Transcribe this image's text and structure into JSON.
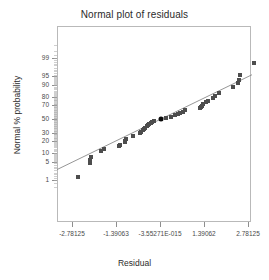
{
  "chart_data": {
    "type": "scatter",
    "title": "Normal plot of residuals",
    "xlabel": "Residual",
    "ylabel": "Normal % probability",
    "grid": false,
    "legend": null,
    "xlim": [
      -3.4,
      3.4
    ],
    "ylim_percent": [
      0.4,
      99.8
    ],
    "x_ticks": [
      {
        "value": -2.78125,
        "label": "-2.78125"
      },
      {
        "value": -1.39063,
        "label": "-1.39063"
      },
      {
        "value": 0,
        "label": "-3.55271E-015"
      },
      {
        "value": 1.39062,
        "label": "1.39062"
      },
      {
        "value": 2.78125,
        "label": "2.78125"
      }
    ],
    "y_ticks": [
      {
        "value": 99,
        "label": "99"
      },
      {
        "value": 95,
        "label": "95"
      },
      {
        "value": 90,
        "label": "90"
      },
      {
        "value": 80,
        "label": "80"
      },
      {
        "value": 70,
        "label": "70"
      },
      {
        "value": 50,
        "label": "50"
      },
      {
        "value": 30,
        "label": "30"
      },
      {
        "value": 20,
        "label": "20"
      },
      {
        "value": 10,
        "label": "10"
      },
      {
        "value": 5,
        "label": "5"
      },
      {
        "value": 1,
        "label": "1"
      }
    ],
    "reference_line": {
      "name": "normal-reference-line",
      "color": "#8a8a8a",
      "x_start": -3.4,
      "y_start_percent": 2.2,
      "x_end": 3.4,
      "y_end_percent": 97.6
    },
    "series": [
      {
        "name": "residual-points",
        "marker": "square",
        "color": "#4d4d4d",
        "points": [
          {
            "x": -2.6,
            "p": 1.4
          },
          {
            "x": -2.22,
            "p": 4.5
          },
          {
            "x": -2.2,
            "p": 6.1
          },
          {
            "x": -2.18,
            "p": 7.4
          },
          {
            "x": -1.86,
            "p": 11.0
          },
          {
            "x": -1.76,
            "p": 12.4
          },
          {
            "x": -1.3,
            "p": 15.0
          },
          {
            "x": -1.28,
            "p": 16.4
          },
          {
            "x": -1.12,
            "p": 18.8
          },
          {
            "x": -1.1,
            "p": 20.6
          },
          {
            "x": -1.08,
            "p": 22.2
          },
          {
            "x": -0.86,
            "p": 25.4
          },
          {
            "x": -0.62,
            "p": 30.0
          },
          {
            "x": -0.6,
            "p": 31.5
          },
          {
            "x": -0.54,
            "p": 33.2
          },
          {
            "x": -0.5,
            "p": 35.0
          },
          {
            "x": -0.46,
            "p": 37.0
          },
          {
            "x": -0.42,
            "p": 39.0
          },
          {
            "x": -0.38,
            "p": 41.0
          },
          {
            "x": -0.34,
            "p": 42.8
          },
          {
            "x": -0.3,
            "p": 44.6
          },
          {
            "x": -0.26,
            "p": 46.2
          },
          {
            "x": -0.2,
            "p": 47.6
          },
          {
            "x": 0.18,
            "p": 51.8
          },
          {
            "x": 0.34,
            "p": 53.5
          },
          {
            "x": 0.46,
            "p": 55.5
          },
          {
            "x": 0.58,
            "p": 57.5
          },
          {
            "x": 0.62,
            "p": 59.2
          },
          {
            "x": 0.74,
            "p": 61.0
          },
          {
            "x": 0.78,
            "p": 62.8
          },
          {
            "x": 1.26,
            "p": 66.0
          },
          {
            "x": 1.3,
            "p": 67.8
          },
          {
            "x": 1.34,
            "p": 69.6
          },
          {
            "x": 1.36,
            "p": 71.4
          },
          {
            "x": 1.44,
            "p": 73.6
          },
          {
            "x": 1.52,
            "p": 75.8
          },
          {
            "x": 1.68,
            "p": 78.4
          },
          {
            "x": 1.74,
            "p": 80.8
          },
          {
            "x": 1.86,
            "p": 83.6
          },
          {
            "x": 2.3,
            "p": 88.6
          },
          {
            "x": 2.48,
            "p": 91.5
          },
          {
            "x": 2.5,
            "p": 93.0
          },
          {
            "x": 2.54,
            "p": 95.2
          },
          {
            "x": 2.96,
            "p": 98.3
          }
        ]
      },
      {
        "name": "highlighted-point",
        "marker": "circle",
        "color": "#0a0a0a",
        "points": [
          {
            "x": 0.02,
            "p": 50.0
          }
        ]
      }
    ]
  }
}
